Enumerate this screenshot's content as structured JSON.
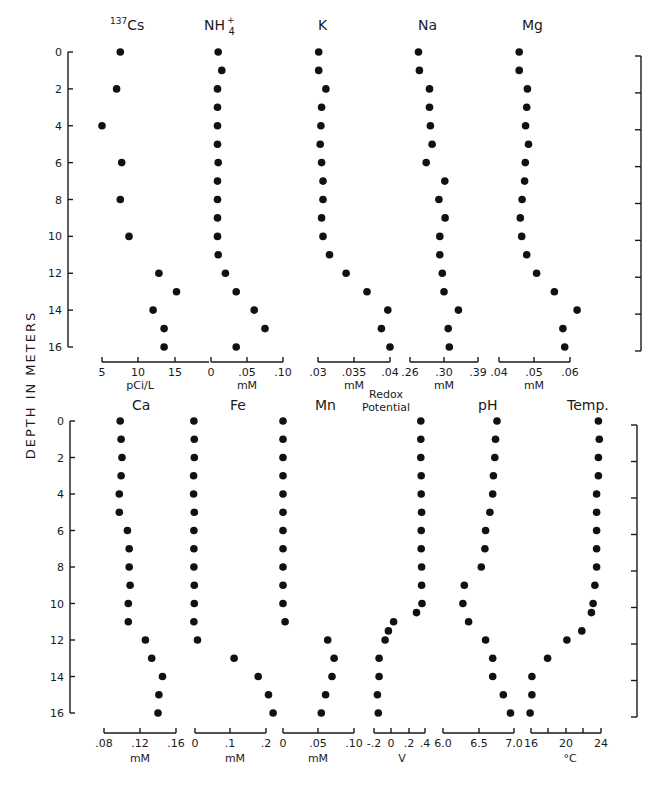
{
  "figure": {
    "ylabel": "DEPTH IN METERS",
    "depth_ticks": [
      0,
      2,
      4,
      6,
      8,
      10,
      12,
      14,
      16
    ]
  },
  "chart_data": [
    {
      "type": "scatter",
      "title": "137Cs",
      "xlabel": "pCi/L",
      "ylabel": "DEPTH IN METERS",
      "xticks": [
        "5",
        "10",
        "15"
      ],
      "xlim": [
        5,
        17
      ],
      "ylim": [
        16,
        0
      ],
      "points": [
        [
          0,
          7.5
        ],
        [
          2,
          7
        ],
        [
          4,
          5
        ],
        [
          6,
          7.7
        ],
        [
          8,
          7.5
        ],
        [
          10,
          8.7
        ],
        [
          12,
          12.8
        ],
        [
          13,
          15.2
        ],
        [
          14,
          12
        ],
        [
          15,
          13.5
        ],
        [
          16,
          13.5
        ]
      ]
    },
    {
      "type": "scatter",
      "title": "NH4+",
      "xlabel": "mM",
      "ylabel": "DEPTH IN METERS",
      "xticks": [
        "0",
        ".05",
        ".10"
      ],
      "xlim": [
        0,
        0.1
      ],
      "ylim": [
        16,
        0
      ],
      "points": [
        [
          0,
          0.01
        ],
        [
          1,
          0.015
        ],
        [
          2,
          0.009
        ],
        [
          3,
          0.009
        ],
        [
          4,
          0.009
        ],
        [
          5,
          0.009
        ],
        [
          6,
          0.01
        ],
        [
          7,
          0.009
        ],
        [
          8,
          0.009
        ],
        [
          9,
          0.009
        ],
        [
          10,
          0.009
        ],
        [
          11,
          0.01
        ],
        [
          12,
          0.02
        ],
        [
          13,
          0.035
        ],
        [
          14,
          0.06
        ],
        [
          15,
          0.075
        ],
        [
          16,
          0.035
        ]
      ]
    },
    {
      "type": "scatter",
      "title": "K",
      "xlabel": "mM",
      "ylabel": "DEPTH IN METERS",
      "xticks": [
        ".03",
        ".035",
        ".04"
      ],
      "xlim": [
        0.03,
        0.04
      ],
      "ylim": [
        16,
        0
      ],
      "points": [
        [
          0,
          0.0301
        ],
        [
          1,
          0.0301
        ],
        [
          2,
          0.0311
        ],
        [
          3,
          0.0305
        ],
        [
          4,
          0.0304
        ],
        [
          5,
          0.0303
        ],
        [
          6,
          0.0305
        ],
        [
          7,
          0.0307
        ],
        [
          8,
          0.0307
        ],
        [
          9,
          0.0305
        ],
        [
          10,
          0.0307
        ],
        [
          11,
          0.0316
        ],
        [
          12,
          0.0339
        ],
        [
          13,
          0.0368
        ],
        [
          14,
          0.0397
        ],
        [
          15,
          0.0388
        ],
        [
          16,
          0.04
        ]
      ]
    },
    {
      "type": "scatter",
      "title": "Na",
      "xlabel": "mM",
      "ylabel": "DEPTH IN METERS",
      "xticks": [
        ".26",
        ".30",
        ".39"
      ],
      "xlim": [
        0.26,
        0.39
      ],
      "ylim": [
        16,
        0
      ],
      "points": [
        [
          0,
          0.27
        ],
        [
          1,
          0.271
        ],
        [
          2,
          0.283
        ],
        [
          3,
          0.283
        ],
        [
          4,
          0.284
        ],
        [
          5,
          0.286
        ],
        [
          6,
          0.279
        ],
        [
          7,
          0.302
        ],
        [
          8,
          0.294
        ],
        [
          9,
          0.303
        ],
        [
          10,
          0.295
        ],
        [
          11,
          0.295
        ],
        [
          12,
          0.298
        ],
        [
          13,
          0.3
        ],
        [
          14,
          0.338
        ],
        [
          15,
          0.311
        ],
        [
          16,
          0.314
        ]
      ]
    },
    {
      "type": "scatter",
      "title": "Mg",
      "xlabel": "mM",
      "ylabel": "DEPTH IN METERS",
      "xticks": [
        ".04",
        ".05",
        ".06"
      ],
      "xlim": [
        0.04,
        0.06
      ],
      "ylim": [
        16,
        0
      ],
      "points": [
        [
          0,
          0.0457
        ],
        [
          1,
          0.0457
        ],
        [
          2,
          0.048
        ],
        [
          3,
          0.0478
        ],
        [
          4,
          0.0475
        ],
        [
          5,
          0.0483
        ],
        [
          6,
          0.0474
        ],
        [
          7,
          0.0472
        ],
        [
          8,
          0.0465
        ],
        [
          9,
          0.046
        ],
        [
          10,
          0.0464
        ],
        [
          11,
          0.0478
        ],
        [
          12,
          0.0506
        ],
        [
          13,
          0.0556
        ],
        [
          14,
          0.062
        ],
        [
          15,
          0.058
        ],
        [
          16,
          0.0585
        ]
      ]
    },
    {
      "type": "scatter",
      "title": "Ca",
      "xlabel": "mM",
      "ylabel": "DEPTH IN METERS",
      "xticks": [
        ".08",
        ".12",
        ".16"
      ],
      "xlim": [
        0.08,
        0.16
      ],
      "ylim": [
        16,
        0
      ],
      "points": [
        [
          0,
          0.098
        ],
        [
          1,
          0.099
        ],
        [
          2,
          0.1
        ],
        [
          3,
          0.099
        ],
        [
          4,
          0.097
        ],
        [
          5,
          0.097
        ],
        [
          6,
          0.106
        ],
        [
          7,
          0.108
        ],
        [
          8,
          0.108
        ],
        [
          9,
          0.109
        ],
        [
          10,
          0.107
        ],
        [
          11,
          0.107
        ],
        [
          12,
          0.126
        ],
        [
          13,
          0.133
        ],
        [
          14,
          0.145
        ],
        [
          15,
          0.141
        ],
        [
          16,
          0.14
        ]
      ]
    },
    {
      "type": "scatter",
      "title": "Fe",
      "xlabel": "mM",
      "ylabel": "DEPTH IN METERS",
      "xticks": [
        "0",
        ".1",
        ".2"
      ],
      "xlim": [
        0,
        0.2
      ],
      "ylim": [
        16,
        0
      ],
      "points": [
        [
          0,
          -0.003
        ],
        [
          1,
          -0.002
        ],
        [
          2,
          -0.002
        ],
        [
          3,
          -0.004
        ],
        [
          4,
          -0.004
        ],
        [
          5,
          -0.002
        ],
        [
          6,
          -0.003
        ],
        [
          7,
          -0.003
        ],
        [
          8,
          -0.003
        ],
        [
          9,
          -0.002
        ],
        [
          10,
          -0.002
        ],
        [
          11,
          -0.003
        ],
        [
          12,
          0.007
        ],
        [
          13,
          0.11
        ],
        [
          14,
          0.178
        ],
        [
          15,
          0.207
        ],
        [
          16,
          0.22
        ]
      ]
    },
    {
      "type": "scatter",
      "title": "Mn",
      "xlabel": "mM",
      "ylabel": "DEPTH IN METERS",
      "xticks": [
        "0",
        ".05",
        ".10"
      ],
      "xlim": [
        0,
        0.1
      ],
      "ylim": [
        16,
        0
      ],
      "points": [
        [
          0,
          0.0
        ],
        [
          1,
          0.0
        ],
        [
          2,
          0.0
        ],
        [
          3,
          0.0
        ],
        [
          4,
          0.0
        ],
        [
          5,
          0.0
        ],
        [
          6,
          0.0
        ],
        [
          7,
          0.0
        ],
        [
          8,
          0.0
        ],
        [
          9,
          0.0
        ],
        [
          10,
          0.0
        ],
        [
          11,
          0.003
        ],
        [
          12,
          0.063
        ],
        [
          13,
          0.072
        ],
        [
          14,
          0.069
        ],
        [
          15,
          0.06
        ],
        [
          16,
          0.054
        ]
      ]
    },
    {
      "type": "scatter",
      "title": "Redox Potential",
      "xlabel": "V",
      "ylabel": "DEPTH IN METERS",
      "xticks": [
        "-.2",
        "0",
        ".2",
        ".4"
      ],
      "xlim": [
        -0.2,
        0.4
      ],
      "ylim": [
        16,
        0
      ],
      "points": [
        [
          0,
          0.35
        ],
        [
          1,
          0.35
        ],
        [
          2,
          0.35
        ],
        [
          3,
          0.355
        ],
        [
          4,
          0.355
        ],
        [
          5,
          0.36
        ],
        [
          6,
          0.355
        ],
        [
          7,
          0.355
        ],
        [
          8,
          0.36
        ],
        [
          9,
          0.36
        ],
        [
          10,
          0.365
        ],
        [
          10.5,
          0.3
        ],
        [
          11,
          0.03
        ],
        [
          11.5,
          -0.03
        ],
        [
          12,
          -0.07
        ],
        [
          13,
          -0.14
        ],
        [
          14,
          -0.14
        ],
        [
          15,
          -0.16
        ],
        [
          16,
          -0.15
        ]
      ]
    },
    {
      "type": "scatter",
      "title": "pH",
      "xlabel": "",
      "ylabel": "DEPTH IN METERS",
      "xticks": [
        "6.0",
        "6.5",
        "7.0"
      ],
      "xlim": [
        6.0,
        7.0
      ],
      "ylim": [
        16,
        0
      ],
      "points": [
        [
          0,
          6.76
        ],
        [
          1,
          6.74
        ],
        [
          2,
          6.73
        ],
        [
          3,
          6.71
        ],
        [
          4,
          6.7
        ],
        [
          5,
          6.66
        ],
        [
          6,
          6.6
        ],
        [
          7,
          6.59
        ],
        [
          8,
          6.54
        ],
        [
          9,
          6.3
        ],
        [
          10,
          6.28
        ],
        [
          11,
          6.36
        ],
        [
          12,
          6.6
        ],
        [
          13,
          6.7
        ],
        [
          14,
          6.7
        ],
        [
          15,
          6.85
        ],
        [
          16,
          6.95
        ]
      ]
    },
    {
      "type": "scatter",
      "title": "Temp.",
      "xlabel": "°C",
      "ylabel": "DEPTH IN METERS",
      "xticks": [
        "16",
        "20",
        "24"
      ],
      "xlim": [
        16,
        24
      ],
      "ylim": [
        16,
        0
      ],
      "points": [
        [
          0,
          23.7
        ],
        [
          1,
          23.8
        ],
        [
          2,
          23.7
        ],
        [
          3,
          23.7
        ],
        [
          4,
          23.5
        ],
        [
          5,
          23.5
        ],
        [
          6,
          23.5
        ],
        [
          7,
          23.5
        ],
        [
          8,
          23.5
        ],
        [
          9,
          23.3
        ],
        [
          10,
          23.1
        ],
        [
          10.5,
          22.9
        ],
        [
          11.5,
          21.8
        ],
        [
          12,
          20.1
        ],
        [
          13,
          17.9
        ],
        [
          14,
          16.1
        ],
        [
          15,
          16.1
        ],
        [
          16,
          15.9
        ]
      ]
    }
  ]
}
